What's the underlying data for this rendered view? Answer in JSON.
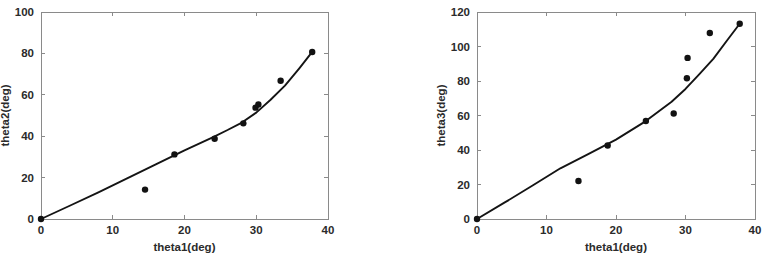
{
  "figure": {
    "background": "#ffffff",
    "panel_count": 2
  },
  "chart_data": [
    {
      "id": "left",
      "type": "scatter",
      "title": "",
      "xlabel": "theta1(deg)",
      "ylabel": "theta2(deg)",
      "xlim": [
        0,
        40
      ],
      "ylim": [
        0,
        100
      ],
      "xticks": [
        0,
        10,
        20,
        30,
        40
      ],
      "yticks": [
        0,
        20,
        40,
        60,
        80,
        100
      ],
      "xticklabels": [
        "0",
        "10",
        "20",
        "30",
        "40"
      ],
      "yticklabels": [
        "0",
        "20",
        "40",
        "60",
        "80",
        "100"
      ],
      "grid": false,
      "legend": null,
      "marker_color": "#121212",
      "line_color": "#141414",
      "series": [
        {
          "name": "measured",
          "kind": "scatter",
          "x": [
            0,
            14.5,
            18.6,
            24.2,
            28.2,
            29.9,
            30.3,
            33.4,
            37.8
          ],
          "y": [
            0,
            14.2,
            31.2,
            38.8,
            46.2,
            53.8,
            55.3,
            66.8,
            80.7
          ]
        },
        {
          "name": "fit",
          "kind": "line",
          "x": [
            0,
            4,
            8,
            12,
            16,
            20,
            24,
            26,
            28,
            30,
            32,
            34,
            36,
            37.8
          ],
          "y": [
            0,
            6.4,
            12.9,
            19.6,
            26.4,
            33.2,
            39.6,
            43.0,
            46.6,
            51.4,
            57.6,
            64.4,
            72.8,
            80.7
          ]
        }
      ]
    },
    {
      "id": "right",
      "type": "scatter",
      "title": "",
      "xlabel": "theta1(deg)",
      "ylabel": "theta3(deg)",
      "xlim": [
        0,
        40
      ],
      "ylim": [
        0,
        120
      ],
      "xticks": [
        0,
        10,
        20,
        30,
        40
      ],
      "yticks": [
        0,
        20,
        40,
        60,
        80,
        100,
        120
      ],
      "xticklabels": [
        "0",
        "10",
        "20",
        "30",
        "40"
      ],
      "yticklabels": [
        "0",
        "20",
        "40",
        "60",
        "80",
        "100",
        "120"
      ],
      "grid": false,
      "legend": null,
      "marker_color": "#121212",
      "line_color": "#141414",
      "series": [
        {
          "name": "measured",
          "kind": "scatter",
          "x": [
            0,
            14.6,
            18.8,
            24.3,
            28.3,
            30.2,
            30.3,
            33.5,
            37.8
          ],
          "y": [
            0,
            22.0,
            42.6,
            56.8,
            61.2,
            81.6,
            93.4,
            107.8,
            113.2
          ]
        },
        {
          "name": "fit",
          "kind": "line",
          "x": [
            0,
            4,
            8,
            12,
            16,
            20,
            24,
            28,
            30,
            32,
            34,
            36,
            37.8
          ],
          "y": [
            0,
            9.6,
            19.4,
            29.4,
            37.6,
            46.0,
            56.0,
            68.0,
            75.4,
            84.0,
            92.8,
            103.6,
            113.2
          ]
        }
      ]
    }
  ]
}
